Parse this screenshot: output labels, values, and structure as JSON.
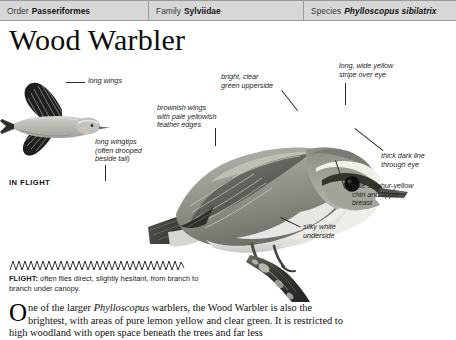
{
  "taxonomy": {
    "order": {
      "key": "Order",
      "value": "Passeriformes"
    },
    "family": {
      "key": "Family",
      "value": "Sylviidae"
    },
    "species": {
      "key": "Species",
      "value": "Phylloscopus sibilatrix"
    }
  },
  "page_title": "Wood Warbler",
  "in_flight_caption": "IN FLIGHT",
  "callouts": {
    "long_wings": "long wings",
    "long_wingtips": "long wingtips\n(often drooped\nbeside tail)",
    "brownish_wings": "brownish wings\nwith pale yellowish\nfeather edges",
    "green_upperside": "bright, clear\ngreen upperside",
    "yellow_stripe": "long, wide yellow\nstripe over eye",
    "dark_line": "thick dark line\nthrough eye",
    "sulphur_chin": "pale sulphur-yellow\nchin and upper\nbreast",
    "silky_underside": "silky white\nunderside"
  },
  "flight_note": {
    "label": "FLIGHT:",
    "text": " often flies direct, slightly hesitant, from branch to branch under canopy."
  },
  "body_text": {
    "dropcap": "O",
    "line1_a": "ne of the larger ",
    "line1_italic": "Phylloscopus",
    "line1_b": " warblers, the Wood Warbler is also",
    "line2": "the brightest, with areas of pure lemon yellow and clear green. It is",
    "line3": "restricted to high woodland with open space beneath the trees and far less"
  },
  "colors": {
    "header_bg": "#d7d7d7",
    "header_rule": "#9a9a9a",
    "text": "#111111",
    "leader_line": "#2b2b2b",
    "bird_dark": "#4a4a48",
    "bird_mid": "#8d8d88",
    "bird_light": "#cfcfca",
    "bird_pale": "#efefec",
    "branch": "#3c3a37"
  }
}
